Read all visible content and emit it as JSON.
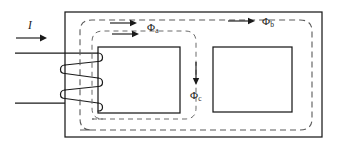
{
  "figure": {
    "type": "engineering-diagram",
    "background_color": "#ffffff",
    "line_color": "#1a1a1a",
    "dashed_flux_color": "#5a5a5a"
  },
  "labels": {
    "current": "I",
    "flux_a": "Φ",
    "flux_a_sub": "a",
    "flux_b": "Φ",
    "flux_b_sub": "b",
    "flux_c": "Φ",
    "flux_c_sub": "c"
  },
  "geometry": {
    "outer_core": {
      "x": 65,
      "y": 12,
      "width": 257,
      "height": 125
    },
    "left_window": {
      "x": 98,
      "y": 47,
      "width": 82,
      "height": 66
    },
    "right_window": {
      "x": 213,
      "y": 47,
      "width": 79,
      "height": 65
    },
    "lead_top_y": 53,
    "lead_bottom_y": 103,
    "lead_left_x": 15,
    "coil_turns": 3
  },
  "annotations": {
    "current_arrow_direction": "right",
    "flux_a_arrow_direction": "right",
    "flux_b_arrow_direction": "right",
    "flux_c_arrow_direction": "down"
  }
}
